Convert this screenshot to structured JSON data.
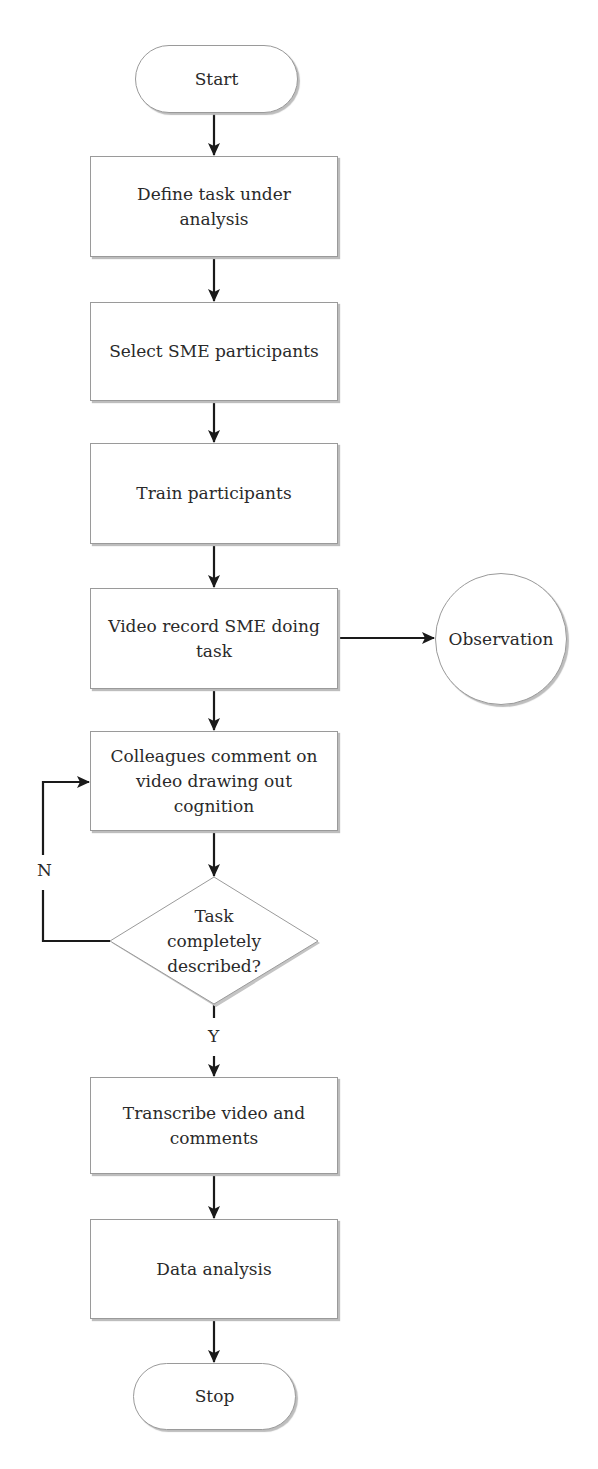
{
  "diagram": {
    "type": "flowchart",
    "nodes": [
      {
        "id": "start",
        "shape": "terminal",
        "label": "Start"
      },
      {
        "id": "define",
        "shape": "process",
        "label": "Define task under analysis"
      },
      {
        "id": "select",
        "shape": "process",
        "label": "Select SME participants"
      },
      {
        "id": "train",
        "shape": "process",
        "label": "Train participants"
      },
      {
        "id": "video",
        "shape": "process",
        "label": "Video record SME doing task"
      },
      {
        "id": "observation",
        "shape": "connector",
        "label": "Observation"
      },
      {
        "id": "colleagues",
        "shape": "process",
        "label": "Colleagues comment on video drawing out cognition"
      },
      {
        "id": "decision",
        "shape": "decision",
        "label": "Task completely described?"
      },
      {
        "id": "transcribe",
        "shape": "process",
        "label": "Transcribe video and comments"
      },
      {
        "id": "analysis",
        "shape": "process",
        "label": "Data analysis"
      },
      {
        "id": "stop",
        "shape": "terminal",
        "label": "Stop"
      }
    ],
    "edges": [
      {
        "from": "start",
        "to": "define"
      },
      {
        "from": "define",
        "to": "select"
      },
      {
        "from": "select",
        "to": "train"
      },
      {
        "from": "train",
        "to": "video"
      },
      {
        "from": "video",
        "to": "observation"
      },
      {
        "from": "video",
        "to": "colleagues"
      },
      {
        "from": "colleagues",
        "to": "decision"
      },
      {
        "from": "decision",
        "to": "colleagues",
        "label": "N"
      },
      {
        "from": "decision",
        "to": "transcribe",
        "label": "Y"
      },
      {
        "from": "transcribe",
        "to": "analysis"
      },
      {
        "from": "analysis",
        "to": "stop"
      }
    ]
  },
  "labels": {
    "start": "Start",
    "define_line1": "Define task under",
    "define_line2": "analysis",
    "select": "Select SME participants",
    "train": "Train participants",
    "video_line1": "Video record SME doing",
    "video_line2": "task",
    "observation": "Observation",
    "colleagues_line1": "Colleagues comment on",
    "colleagues_line2": "video drawing out",
    "colleagues_line3": "cognition",
    "decision_line1": "Task",
    "decision_line2": "completely",
    "decision_line3": "described?",
    "no": "N",
    "yes": "Y",
    "transcribe_line1": "Transcribe video and",
    "transcribe_line2": "comments",
    "analysis": "Data analysis",
    "stop": "Stop"
  },
  "colors": {
    "line": "#1a1a1a",
    "border": "#9a9a9a",
    "shadow": "#bdbdbd",
    "text": "#2a2a2a",
    "background": "#ffffff"
  }
}
